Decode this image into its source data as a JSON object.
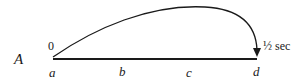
{
  "diagram": {
    "row_label": "A",
    "start_value": "0",
    "end_label": "½ sec",
    "points": [
      {
        "id": "a",
        "label": "a"
      },
      {
        "id": "b",
        "label": "b"
      },
      {
        "id": "c",
        "label": "c"
      },
      {
        "id": "d",
        "label": "d"
      }
    ],
    "colors": {
      "ink": "#1a1a1a",
      "background": "#ffffff"
    }
  }
}
